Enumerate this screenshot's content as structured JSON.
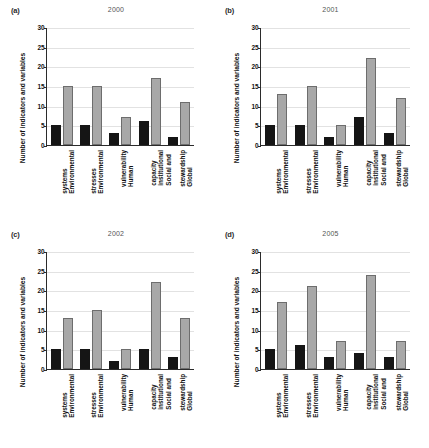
{
  "figure": {
    "ylabel": "Number of indicators and variables",
    "categories": [
      [
        "Environmental",
        "systems"
      ],
      [
        "Environmental",
        "stresses"
      ],
      [
        "Human",
        "vulnerability"
      ],
      [
        "Social and",
        "institutional",
        "capacity"
      ],
      [
        "Global",
        "stewardship"
      ]
    ],
    "yticks": [
      "0",
      "5",
      "10",
      "15",
      "20",
      "25",
      "30"
    ],
    "series_colors": {
      "indicators": "#151515",
      "variables": "#a8a8a8"
    }
  },
  "chart_data": [
    {
      "type": "bar",
      "panel": "(a)",
      "title": "2000",
      "categories": [
        "Environmental systems",
        "Environmental stresses",
        "Human vulnerability",
        "Social and institutional capacity",
        "Global stewardship"
      ],
      "series": [
        {
          "name": "Indicators",
          "values": [
            5,
            5,
            3,
            6,
            2
          ],
          "color": "#151515"
        },
        {
          "name": "Variables",
          "values": [
            15,
            15,
            7,
            17,
            11
          ],
          "color": "#a8a8a8"
        }
      ],
      "xlabel": "",
      "ylabel": "Number of indicators and variables",
      "ylim": [
        0,
        30
      ],
      "ytick_step": 5,
      "grid": true,
      "legend": "none"
    },
    {
      "type": "bar",
      "panel": "(b)",
      "title": "2001",
      "categories": [
        "Environmental systems",
        "Environmental stresses",
        "Human vulnerability",
        "Social and institutional capacity",
        "Global stewardship"
      ],
      "series": [
        {
          "name": "Indicators",
          "values": [
            5,
            5,
            2,
            7,
            3
          ],
          "color": "#151515"
        },
        {
          "name": "Variables",
          "values": [
            13,
            15,
            5,
            22,
            12
          ],
          "color": "#a8a8a8"
        }
      ],
      "xlabel": "",
      "ylabel": "Number of indicators and variables",
      "ylim": [
        0,
        30
      ],
      "ytick_step": 5,
      "grid": true,
      "legend": "none"
    },
    {
      "type": "bar",
      "panel": "(c)",
      "title": "2002",
      "categories": [
        "Environmental systems",
        "Environmental stresses",
        "Human vulnerability",
        "Social and institutional capacity",
        "Global stewardship"
      ],
      "series": [
        {
          "name": "Indicators",
          "values": [
            5,
            5,
            2,
            5,
            3
          ],
          "color": "#151515"
        },
        {
          "name": "Variables",
          "values": [
            13,
            15,
            5,
            22,
            13
          ],
          "color": "#a8a8a8"
        }
      ],
      "xlabel": "",
      "ylabel": "Number of indicators and variables",
      "ylim": [
        0,
        30
      ],
      "ytick_step": 5,
      "grid": true,
      "legend": "none"
    },
    {
      "type": "bar",
      "panel": "(d)",
      "title": "2005",
      "categories": [
        "Environmental systems",
        "Environmental stresses",
        "Human vulnerability",
        "Social and institutional capacity",
        "Global stewardship"
      ],
      "series": [
        {
          "name": "Indicators",
          "values": [
            5,
            6,
            3,
            4,
            3
          ],
          "color": "#151515"
        },
        {
          "name": "Variables",
          "values": [
            17,
            21,
            7,
            24,
            7
          ],
          "color": "#a8a8a8"
        }
      ],
      "xlabel": "",
      "ylabel": "Number of indicators and variables",
      "ylim": [
        0,
        30
      ],
      "ytick_step": 5,
      "grid": true,
      "legend": "none"
    }
  ]
}
